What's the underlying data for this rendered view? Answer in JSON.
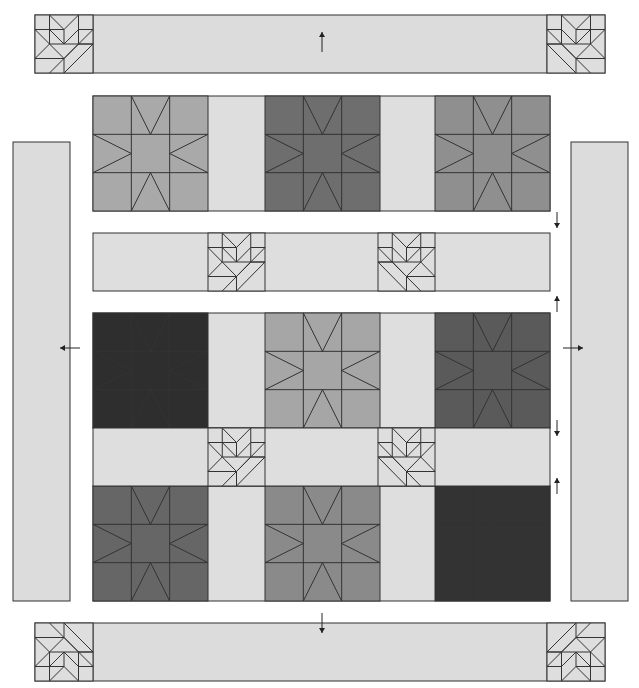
{
  "diagram": {
    "colors": {
      "background": "#ffffff",
      "sashing": "#dedede",
      "border": "#dcdcdc",
      "line": "#333333",
      "arrow": "#222222"
    },
    "block_size": 115,
    "sashing_width": 57,
    "top_border": {
      "x": 35,
      "y": 15,
      "w": 570,
      "h": 58,
      "corner_w": 58,
      "arrow": "up"
    },
    "bottom_border": {
      "x": 35,
      "y": 623,
      "w": 570,
      "h": 58,
      "corner_w": 58,
      "arrow": "down"
    },
    "left_border": {
      "x": 13,
      "y": 142,
      "w": 57,
      "h": 459,
      "arrow": "left"
    },
    "right_border": {
      "x": 571,
      "y": 142,
      "w": 57,
      "h": 459,
      "arrow": "right"
    },
    "star_rows": [
      {
        "y": 96,
        "colors": [
          "#a9a9a9",
          "#6e6e6e",
          "#8f8f8f"
        ]
      },
      {
        "y": 313,
        "colors": [
          "#2e2e2e",
          "#a6a6a6",
          "#5a5a5a"
        ]
      },
      {
        "y": 486,
        "colors": [
          "#666666",
          "#8a8a8a",
          "#333333"
        ]
      }
    ],
    "block_columns_x": [
      93,
      265,
      435
    ],
    "sashing_rows": [
      {
        "y": 233,
        "h": 58,
        "arrows": [
          "down-above",
          "up-below"
        ]
      },
      {
        "y": 428,
        "h": 58,
        "arrows": [
          "down-above",
          "up-below"
        ]
      }
    ],
    "cornerstone_columns_x": [
      208,
      378
    ],
    "grid_x": 93,
    "grid_w": 457,
    "arrows": [
      {
        "name": "top-border-arrow",
        "x": 322,
        "y1": 52,
        "y2": 32,
        "dir": "up"
      },
      {
        "name": "bottom-border-arrow",
        "x": 322,
        "y1": 613,
        "y2": 633,
        "dir": "down"
      },
      {
        "name": "left-border-arrow",
        "y": 348,
        "x1": 80,
        "x2": 60,
        "dir": "left"
      },
      {
        "name": "right-border-arrow",
        "y": 348,
        "x1": 563,
        "x2": 583,
        "dir": "right"
      },
      {
        "name": "row1-down-arrow",
        "x": 557,
        "y1": 212,
        "y2": 228,
        "dir": "down"
      },
      {
        "name": "sash1-up-arrow",
        "x": 557,
        "y1": 312,
        "y2": 296,
        "dir": "up"
      },
      {
        "name": "row2-down-arrow",
        "x": 557,
        "y1": 420,
        "y2": 436,
        "dir": "down"
      },
      {
        "name": "sash2-up-arrow",
        "x": 557,
        "y1": 494,
        "y2": 478,
        "dir": "up"
      }
    ]
  }
}
